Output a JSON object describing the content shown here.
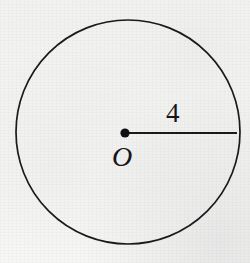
{
  "figure": {
    "type": "geometry-diagram",
    "background_color": "#f8f8f6",
    "ink_color": "#1a1a1e",
    "circle": {
      "center_x": 128,
      "center_y": 132,
      "radius_px": 112,
      "stroke_width": 1.7
    },
    "center_point": {
      "name": "center-dot",
      "x": 125,
      "y": 133,
      "dot_radius": 4.6,
      "fill": "#101014"
    },
    "radius_segment": {
      "name": "radius-line",
      "x1": 125,
      "y1": 133,
      "x2": 237,
      "y2": 133,
      "stroke_width": 2.1
    },
    "labels": {
      "radius_length": "4",
      "center_point_label": "O"
    }
  }
}
